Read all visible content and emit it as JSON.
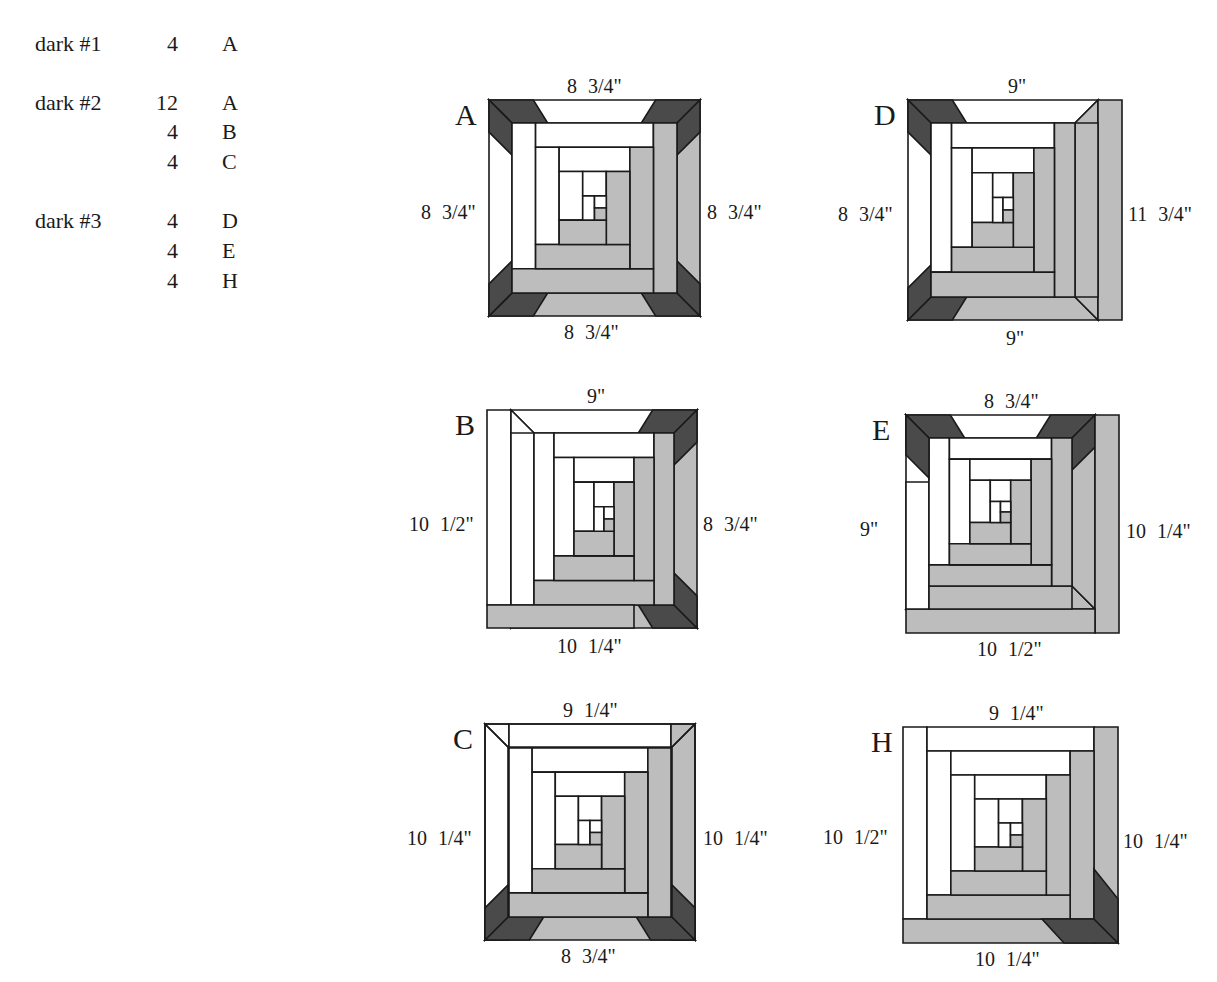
{
  "legend": {
    "rows": [
      {
        "fabric": "dark #1",
        "qty": "4",
        "block": "A",
        "y": 33
      },
      {
        "fabric": "dark #2",
        "qty": "12",
        "block": "A",
        "y": 92
      },
      {
        "fabric": "",
        "qty": "4",
        "block": "B",
        "y": 121
      },
      {
        "fabric": "",
        "qty": "4",
        "block": "C",
        "y": 151
      },
      {
        "fabric": "dark #3",
        "qty": "4",
        "block": "D",
        "y": 210
      },
      {
        "fabric": "",
        "qty": "4",
        "block": "E",
        "y": 240
      },
      {
        "fabric": "",
        "qty": "4",
        "block": "H",
        "y": 270
      }
    ]
  },
  "colors": {
    "light": "#ffffff",
    "medium": "#bdbdbd",
    "dark": "#4a4a4a",
    "line": "#1a1a1a"
  },
  "blocks": [
    {
      "id": "A",
      "label": "A",
      "top": "8 3/4\"",
      "left": "8 3/4\"",
      "right": "8 3/4\"",
      "bottom": "8 3/4\"",
      "dark_corners": [
        "tl",
        "tr",
        "bl",
        "br"
      ],
      "outer": "frame"
    },
    {
      "id": "D",
      "label": "D",
      "top": "9\"",
      "left": "8 3/4\"",
      "right": "11 3/4\"",
      "bottom": "9\"",
      "dark_corners": [
        "tl",
        "bl"
      ],
      "outer": "right-log"
    },
    {
      "id": "B",
      "label": "B",
      "top": "9\"",
      "left": "10 1/2\"",
      "right": "8 3/4\"",
      "bottom": "10 1/4\"",
      "dark_corners": [
        "tr",
        "br"
      ],
      "outer": "left-log"
    },
    {
      "id": "E",
      "label": "E",
      "top": "8 3/4\"",
      "left": "9\"",
      "right": "10 1/4\"",
      "bottom": "10 1/2\"",
      "dark_corners": [
        "tl",
        "tr"
      ],
      "outer": "bottom-right-log"
    },
    {
      "id": "C",
      "label": "C",
      "top": "9 1/4\"",
      "left": "10 1/4\"",
      "right": "10 1/4\"",
      "bottom": "8 3/4\"",
      "dark_corners": [
        "bl",
        "br"
      ],
      "outer": "top-log"
    },
    {
      "id": "H",
      "label": "H",
      "top": "9 1/4\"",
      "left": "10 1/2\"",
      "right": "10 1/4\"",
      "bottom": "10 1/4\"",
      "dark_corners": [
        "br"
      ],
      "outer": "all-log"
    }
  ]
}
